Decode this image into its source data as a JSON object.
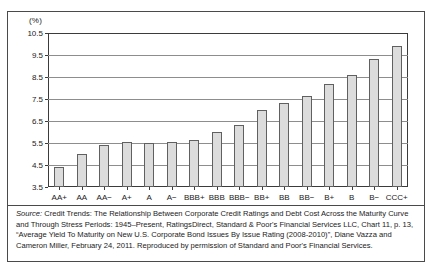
{
  "figure": {
    "y_axis_unit": "(%)"
  },
  "chart_data": {
    "type": "bar",
    "title": "",
    "subtitle": "",
    "xlabel": "",
    "ylabel": "(%)",
    "ylim": [
      3.5,
      10.5
    ],
    "ytick_labels": [
      "10.5",
      "9.5",
      "8.5",
      "7.5",
      "6.5",
      "5.5",
      "4.5",
      "3.5"
    ],
    "ytick_values": [
      10.5,
      9.5,
      8.5,
      7.5,
      6.5,
      5.5,
      4.5,
      3.5
    ],
    "grid": true,
    "legend": "none",
    "bar_color": "#dcdcdc",
    "bar_edge_color": "#606060",
    "categories": [
      "AA+",
      "AA",
      "AA−",
      "A+",
      "A",
      "A−",
      "BBB+",
      "BBB",
      "BBB−",
      "BB+",
      "BB",
      "BB−",
      "B+",
      "B",
      "B−",
      "CCC+"
    ],
    "values": [
      4.4,
      5.0,
      5.4,
      5.55,
      5.5,
      5.55,
      5.65,
      6.0,
      6.3,
      7.0,
      7.3,
      7.65,
      8.2,
      8.6,
      9.3,
      9.9
    ]
  },
  "source": {
    "label": "Source:",
    "text": " Credit Trends: The Relationship Between Corporate Credit Ratings and Debt Cost Across the Maturity Curve and Through Stress Periods: 1945–Present, RatingsDirect, Standard & Poor's Financial Services LLC, Chart 11, p. 13, “Average Yield To Maturity on New U.S. Corporate Bond Issues By Issue Rating (2008-2010)”, Diane Vazza and Cameron Miller, February 24, 2011. Reproduced by permission of Standard and Poor's Financial Services."
  }
}
